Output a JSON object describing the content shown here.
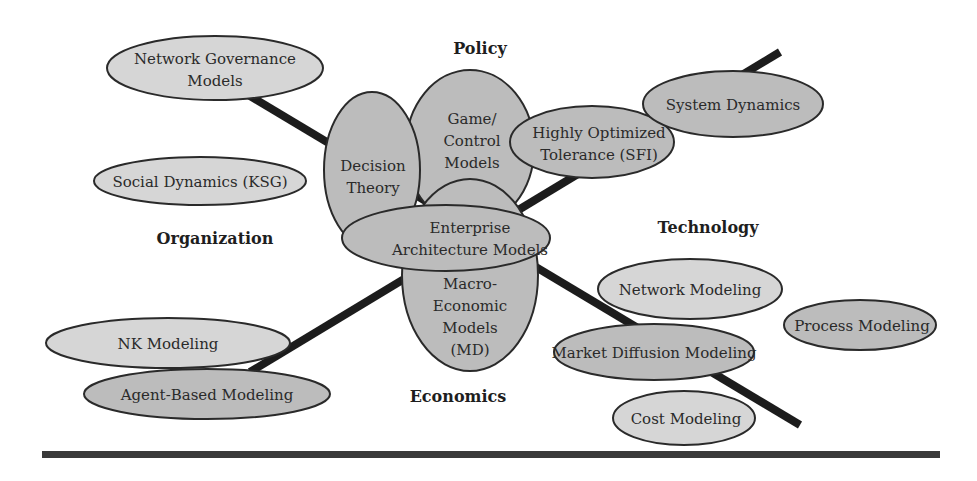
{
  "diagram": {
    "axes": {
      "policy": "Policy",
      "organization": "Organization",
      "technology": "Technology",
      "economics": "Economics"
    },
    "nodes": {
      "network_governance": [
        "Network Governance",
        "Models"
      ],
      "social_dynamics": [
        "Social Dynamics (KSG)"
      ],
      "decision_theory": [
        "Decision",
        "Theory"
      ],
      "game_control": [
        "Game/",
        "Control",
        "Models"
      ],
      "highly_optimized": [
        "Highly Optimized",
        "Tolerance (SFI)"
      ],
      "system_dynamics": [
        "System Dynamics"
      ],
      "enterprise_architecture": [
        "Enterprise",
        "Architecture Models"
      ],
      "macro_economic": [
        "Macro-",
        "Economic",
        "Models",
        "(MD)"
      ],
      "network_modeling": [
        "Network Modeling"
      ],
      "process_modeling": [
        "Process Modeling"
      ],
      "market_diffusion": [
        "Market Diffusion Modeling"
      ],
      "cost_modeling": [
        "Cost Modeling"
      ],
      "nk_modeling": [
        "NK Modeling"
      ],
      "agent_based": [
        "Agent-Based Modeling"
      ]
    },
    "colors": {
      "light_fill": "#d6d6d6",
      "dark_fill": "#bcbcbc",
      "stroke": "#2a2a2a",
      "axis": "#1c1c1c"
    }
  }
}
